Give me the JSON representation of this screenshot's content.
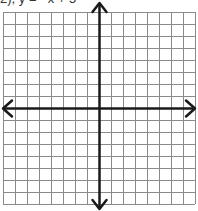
{
  "caption": "2), y = −x + 5",
  "grid": {
    "columns": 16,
    "rows": 16,
    "cell_size": 12,
    "left": 3,
    "top": 12,
    "line_color": "#8a8a8a",
    "axis_color": "#1a1a1a"
  },
  "axes": {
    "x_axis": {
      "label": "x-axis",
      "arrows": "both"
    },
    "y_axis": {
      "label": "y-axis",
      "arrows": "both"
    },
    "origin_col": 8,
    "origin_row": 8
  }
}
